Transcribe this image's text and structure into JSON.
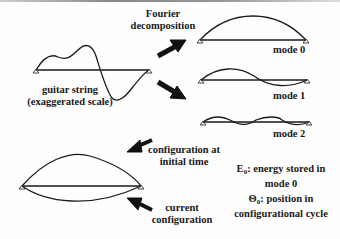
{
  "labels": {
    "fourier_line1": "Fourier",
    "fourier_line2": "decomposition",
    "guitar_line1": "guitar string",
    "guitar_line2": "(exaggerated scale)",
    "mode0": "mode 0",
    "mode1": "mode 1",
    "mode2": "mode 2",
    "config_initial_line1": "configuration at",
    "config_initial_line2": "initial time",
    "config_current_line1": "current",
    "config_current_line2": "configuration",
    "energy_symbol": "E",
    "energy_sub": "0",
    "energy_line1": ": energy stored in",
    "energy_line2": "mode 0",
    "theta_symbol": "Θ",
    "theta_sub": "0",
    "theta_line1": ": position in",
    "theta_line2": "configurational cycle"
  },
  "colors": {
    "stroke": "#1a1a1a",
    "arrow": "#111111"
  }
}
